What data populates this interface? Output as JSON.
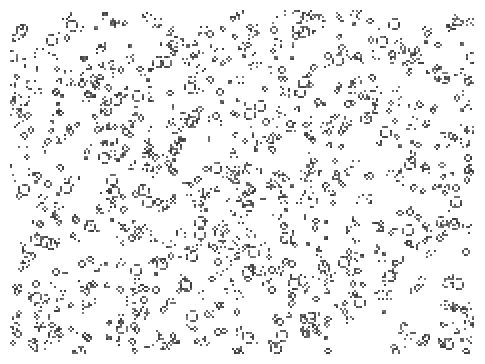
{
  "game": {
    "type": "cellular-automaton",
    "canvas": {
      "width": 485,
      "height": 364
    },
    "grid": {
      "cell_size_px": 2,
      "margin_px": 10
    },
    "colors": {
      "background": "#ffffff",
      "cell": "#3a3a3a"
    },
    "density": {
      "patterns": 520,
      "noise_clusters": 380
    },
    "pattern_kinds": [
      "block",
      "blinker",
      "beehive",
      "loaf",
      "boat",
      "tub",
      "pond",
      "glider",
      "pulsar-fragment",
      "debris"
    ]
  }
}
